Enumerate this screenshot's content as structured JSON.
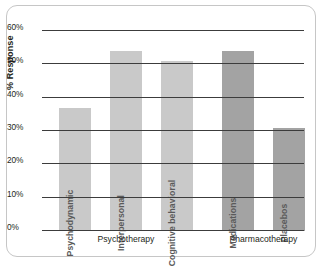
{
  "chart_data": {
    "type": "bar",
    "title": "",
    "xlabel": "",
    "ylabel": "% Response",
    "ylim": [
      0,
      60
    ],
    "grid": true,
    "legend": "none",
    "categories": [
      "Psychodynamic",
      "Interpersonal",
      "Cognitive behavioral",
      "Medications",
      "Placebos"
    ],
    "values": [
      37,
      54,
      51,
      54,
      31
    ],
    "groups": [
      {
        "label": "Psychotherapy",
        "categories": [
          "Psychodynamic",
          "Interpersonal",
          "Cognitive behavioral"
        ],
        "color": "#c9c9c9"
      },
      {
        "label": "Pharmacotherapy",
        "categories": [
          "Medications",
          "Placebos"
        ],
        "color": "#a3a3a3"
      }
    ],
    "yticks": [
      "0%",
      "10%",
      "20%",
      "30%",
      "40%",
      "50%",
      "60%"
    ],
    "ytick_values": [
      0,
      10,
      20,
      30,
      40,
      50,
      60
    ],
    "bar_colors": [
      "#c9c9c9",
      "#c9c9c9",
      "#c9c9c9",
      "#a3a3a3",
      "#a3a3a3"
    ]
  },
  "axis": {
    "y_title": "% Response",
    "ticks": [
      {
        "label": "60%",
        "value": 60
      },
      {
        "label": "50%",
        "value": 50
      },
      {
        "label": "40%",
        "value": 40
      },
      {
        "label": "30%",
        "value": 30
      },
      {
        "label": "20%",
        "value": 20
      },
      {
        "label": "10%",
        "value": 10
      },
      {
        "label": "0%",
        "value": 0
      }
    ]
  },
  "bars": [
    {
      "name": "Psychodynamic",
      "label": "Psychodynamic",
      "value": 37,
      "color": "#c9c9c9"
    },
    {
      "name": "Interpersonal",
      "label": "Interpersonal",
      "value": 54,
      "color": "#c9c9c9"
    },
    {
      "name": "Cognitive behavioral",
      "label": "Cognitive behavioral",
      "value": 51,
      "color": "#c9c9c9"
    },
    {
      "name": "Medications",
      "label": "Medications",
      "value": 54,
      "color": "#a3a3a3"
    },
    {
      "name": "Placebos",
      "label": "Placebos",
      "value": 31,
      "color": "#a3a3a3"
    }
  ],
  "groups": [
    {
      "label": "Psychotherapy"
    },
    {
      "label": "Pharmacotherapy"
    }
  ],
  "colors": {
    "psychotherapy_bar": "#c9c9c9",
    "pharmacotherapy_bar": "#a3a3a3",
    "gridline": "#3c3c3c",
    "frame_border": "#c6c6c6",
    "text": "#231f20",
    "bar_label_text": "#5a5a5a"
  }
}
